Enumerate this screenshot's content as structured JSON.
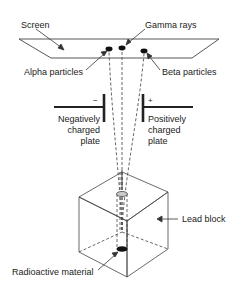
{
  "diagram": {
    "type": "radiation-deflection-experiment",
    "labels": {
      "screen": "Screen",
      "gamma": "Gamma rays",
      "alpha": "Alpha particles",
      "beta": "Beta particles",
      "neg_sign": "−",
      "pos_sign": "+",
      "neg_plate": [
        "Negatively",
        "charged",
        "plate"
      ],
      "pos_plate": [
        "Positively",
        "charged",
        "plate"
      ],
      "lead": "Lead block",
      "source": "Radioactive material"
    },
    "colors": {
      "line": "#333333",
      "dark": "#111111",
      "cap": "#cccccc",
      "background": "#ffffff"
    }
  }
}
